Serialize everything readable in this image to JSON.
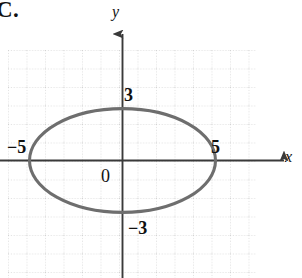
{
  "figure": {
    "choice_label": "C.",
    "background_color": "#ffffff"
  },
  "axes": {
    "x_label": "x",
    "y_label": "y",
    "origin_label": "0",
    "axis_color": "#3a3a3a",
    "grid_color": "#c8c8c8",
    "grid_style": "dotted"
  },
  "tick_labels": {
    "x_negative": "−5",
    "x_positive": "5",
    "y_positive": "3",
    "y_negative": "−3"
  },
  "chart_data": {
    "type": "line",
    "title": "C.",
    "xlabel": "x",
    "ylabel": "y",
    "grid": true,
    "legend": null,
    "curve_name": "ellipse",
    "curve_color": "#6e6e6e",
    "equation": "x^2/25 + y^2/9 = 1",
    "center": [
      0,
      0
    ],
    "semi_axis_x": 5,
    "semi_axis_y": 3,
    "x_intercepts": [
      -5,
      5
    ],
    "y_intercepts": [
      -3,
      3
    ],
    "xlim": [
      -6.5,
      7
    ],
    "ylim": [
      -4.5,
      4.5
    ],
    "annotations": [
      {
        "text": "5",
        "x": 5,
        "y": 0
      },
      {
        "text": "−5",
        "x": -5,
        "y": 0
      },
      {
        "text": "3",
        "x": 0,
        "y": 3
      },
      {
        "text": "−3",
        "x": 0,
        "y": -3
      },
      {
        "text": "0",
        "x": 0,
        "y": 0
      }
    ]
  }
}
